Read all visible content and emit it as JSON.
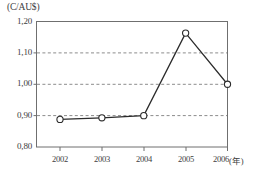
{
  "chart_data": {
    "type": "line",
    "title": "",
    "subtitle": "",
    "unit_label": "(C/AU$)",
    "xlabel": "",
    "xaxis_unit": "(年)",
    "ylabel": "",
    "categories": [
      "2002",
      "2003",
      "2004",
      "2005",
      "2006"
    ],
    "x": [
      2002,
      2003,
      2004,
      2005,
      2006
    ],
    "values": [
      0.888,
      0.893,
      0.9,
      1.163,
      1.0
    ],
    "series": [
      {
        "name": "C/AU$",
        "values": [
          0.888,
          0.893,
          0.9,
          1.163,
          1.0
        ]
      }
    ],
    "ylim": [
      0.8,
      1.2
    ],
    "yticks": [
      0.8,
      0.9,
      1.0,
      1.1,
      1.2
    ],
    "ytick_labels": [
      "0,80",
      "0,90",
      "1,00",
      "1,10",
      "1,20"
    ],
    "xtick_labels": [
      "2002",
      "2003",
      "2004",
      "2005",
      "2006"
    ],
    "grid": "horizontal-dashed",
    "gridlines_at": [
      0.9,
      1.0,
      1.1
    ],
    "legend": "none",
    "marker": "open-circle",
    "line_color": "#2b2b2b",
    "marker_fill": "#ffffff",
    "grid_color": "#8c8c8c",
    "axis_color": "#6f6f6f",
    "background": "#ffffff"
  },
  "axis": {
    "y_labels": [
      "1,20",
      "1,10",
      "1,00",
      "0,90",
      "0,80"
    ],
    "x_labels": [
      "2002",
      "2003",
      "2004",
      "2005",
      "2006"
    ],
    "x_unit": "(年)",
    "unit_header": "(C/AU$)"
  }
}
